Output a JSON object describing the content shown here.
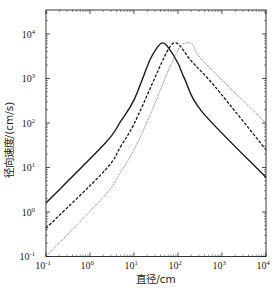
{
  "chart_data": {
    "type": "line",
    "title": "",
    "xlabel": "直径/cm",
    "ylabel": "径向速度/(cm/s)",
    "xscale": "log",
    "yscale": "log",
    "xlim": [
      0.1,
      10000
    ],
    "ylim": [
      0.1,
      35000
    ],
    "grid": false,
    "legend": null,
    "x_ticks": [
      {
        "base": "10",
        "exp": "-1",
        "value": 0.1
      },
      {
        "base": "10",
        "exp": "0",
        "value": 1
      },
      {
        "base": "10",
        "exp": "1",
        "value": 10
      },
      {
        "base": "10",
        "exp": "2",
        "value": 100
      },
      {
        "base": "10",
        "exp": "3",
        "value": 1000
      },
      {
        "base": "10",
        "exp": "4",
        "value": 10000
      }
    ],
    "y_ticks": [
      {
        "base": "10",
        "exp": "-1",
        "value": 0.1
      },
      {
        "base": "10",
        "exp": "0",
        "value": 1
      },
      {
        "base": "10",
        "exp": "1",
        "value": 10
      },
      {
        "base": "10",
        "exp": "2",
        "value": 100
      },
      {
        "base": "10",
        "exp": "3",
        "value": 1000
      },
      {
        "base": "10",
        "exp": "4",
        "value": 10000
      }
    ],
    "series": [
      {
        "name": "solid",
        "style": "solid",
        "color": "#1a1a1a",
        "points": [
          [
            0.1,
            1.6
          ],
          [
            2.2,
            35
          ],
          [
            5,
            110
          ],
          [
            10,
            330
          ],
          [
            23,
            2600
          ],
          [
            35,
            5200
          ],
          [
            45,
            6300
          ],
          [
            60,
            5000
          ],
          [
            100,
            2200
          ],
          [
            145,
            930
          ],
          [
            350,
            180
          ],
          [
            10000,
            6
          ]
        ]
      },
      {
        "name": "dashed",
        "style": "dashed",
        "color": "#1a1a1a",
        "points": [
          [
            0.1,
            0.43
          ],
          [
            2.2,
            8.7
          ],
          [
            5,
            30
          ],
          [
            10,
            95
          ],
          [
            25,
            700
          ],
          [
            50,
            3200
          ],
          [
            70,
            5600
          ],
          [
            85,
            6300
          ],
          [
            110,
            5500
          ],
          [
            200,
            2500
          ],
          [
            700,
            650
          ],
          [
            10000,
            25
          ]
        ]
      },
      {
        "name": "dotted",
        "style": "dotted",
        "color": "#555555",
        "points": [
          [
            0.1,
            0.1
          ],
          [
            2.2,
            2.4
          ],
          [
            5,
            8
          ],
          [
            10,
            25
          ],
          [
            25,
            180
          ],
          [
            60,
            1500
          ],
          [
            110,
            5000
          ],
          [
            160,
            6300
          ],
          [
            220,
            5600
          ],
          [
            400,
            2300
          ],
          [
            10000,
            100
          ]
        ]
      }
    ]
  },
  "axes": {
    "xlabel": "直径/cm",
    "ylabel": "径向速度/(cm/s)"
  }
}
